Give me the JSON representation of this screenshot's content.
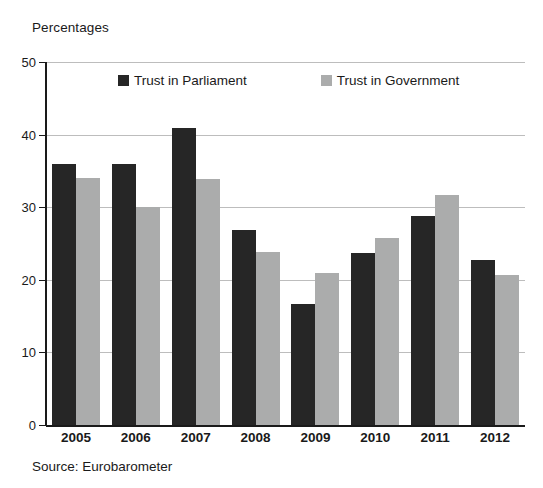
{
  "chart_data": {
    "type": "bar",
    "title": "",
    "ylabel": "Percentages",
    "xlabel": "",
    "categories": [
      "2005",
      "2006",
      "2007",
      "2008",
      "2009",
      "2010",
      "2011",
      "2012"
    ],
    "series": [
      {
        "name": "Trust in Parliament",
        "color": "#262626",
        "values": [
          36.0,
          36.0,
          40.9,
          26.9,
          16.7,
          23.7,
          28.8,
          22.7
        ]
      },
      {
        "name": "Trust in Government",
        "color": "#abacac",
        "values": [
          34.0,
          30.0,
          33.9,
          23.8,
          20.9,
          25.8,
          31.7,
          20.7
        ]
      }
    ],
    "ylim": [
      0,
      50
    ],
    "yticks": [
      0,
      10,
      20,
      30,
      40,
      50
    ],
    "ytick_labels": [
      "0",
      "10",
      "20",
      "30",
      "40",
      "50"
    ],
    "grid": true,
    "grid_axis": "y",
    "legend_position": "top-inside",
    "annotations": [
      "Source: Eurobarometer"
    ]
  },
  "axis_title": "Percentages",
  "source": "Source: Eurobarometer",
  "legend": {
    "entries": [
      {
        "label": "Trust in Parliament",
        "swatch": "#262626"
      },
      {
        "label": "Trust in Government",
        "swatch": "#abacac"
      }
    ]
  }
}
